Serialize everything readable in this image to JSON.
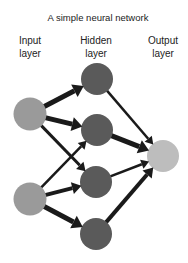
{
  "title": "A simple neural network",
  "layers": {
    "input": {
      "line1": "Input",
      "line2": "layer"
    },
    "hidden": {
      "line1": "Hidden",
      "line2": "layer"
    },
    "output": {
      "line1": "Output",
      "line2": "layer"
    }
  },
  "colors": {
    "input_node": "#9a9a9a",
    "hidden_node": "#5a5a5a",
    "output_node": "#bdbdbd",
    "edge": "#1a1a1a"
  },
  "nodes": [
    {
      "id": "i1",
      "layer": "input",
      "cx": 30,
      "cy": 114,
      "r": 16.5
    },
    {
      "id": "i2",
      "layer": "input",
      "cx": 30,
      "cy": 199,
      "r": 16.5
    },
    {
      "id": "h1",
      "layer": "hidden",
      "cx": 97,
      "cy": 79,
      "r": 16
    },
    {
      "id": "h2",
      "layer": "hidden",
      "cx": 97,
      "cy": 130,
      "r": 16
    },
    {
      "id": "h3",
      "layer": "hidden",
      "cx": 96,
      "cy": 182,
      "r": 16
    },
    {
      "id": "h4",
      "layer": "hidden",
      "cx": 96,
      "cy": 234,
      "r": 16
    },
    {
      "id": "o1",
      "layer": "output",
      "cx": 163,
      "cy": 156,
      "r": 16
    }
  ],
  "edges": [
    {
      "from": "i1",
      "to": "h1",
      "weight": 5
    },
    {
      "from": "i1",
      "to": "h2",
      "weight": 5
    },
    {
      "from": "i1",
      "to": "h3",
      "weight": 3
    },
    {
      "from": "i2",
      "to": "h2",
      "weight": 2.5
    },
    {
      "from": "i2",
      "to": "h3",
      "weight": 4
    },
    {
      "from": "i2",
      "to": "h4",
      "weight": 5
    },
    {
      "from": "h1",
      "to": "o1",
      "weight": 2.5
    },
    {
      "from": "h2",
      "to": "o1",
      "weight": 5
    },
    {
      "from": "h3",
      "to": "o1",
      "weight": 2.5
    },
    {
      "from": "h4",
      "to": "o1",
      "weight": 4
    }
  ]
}
